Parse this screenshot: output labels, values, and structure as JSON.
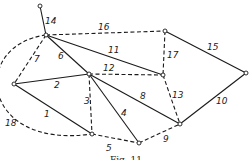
{
  "figure": {
    "caption": "Fig. 11",
    "line_color": "#1a1a1a",
    "background": "#ffffff"
  },
  "nodes": [
    {
      "id": "A",
      "x": 40,
      "y": 6
    },
    {
      "id": "B",
      "x": 46,
      "y": 35
    },
    {
      "id": "C",
      "x": 14,
      "y": 84
    },
    {
      "id": "D",
      "x": 89,
      "y": 74
    },
    {
      "id": "E",
      "x": 92,
      "y": 134
    },
    {
      "id": "F",
      "x": 139,
      "y": 143
    },
    {
      "id": "G",
      "x": 180,
      "y": 124
    },
    {
      "id": "H",
      "x": 163,
      "y": 75
    },
    {
      "id": "I",
      "x": 165,
      "y": 31
    },
    {
      "id": "J",
      "x": 246,
      "y": 73
    }
  ],
  "edges": [
    {
      "label": "1",
      "from": "C",
      "to": "E",
      "style": "solid",
      "lx": 44,
      "ly": 117
    },
    {
      "label": "2",
      "from": "C",
      "to": "D",
      "style": "solid",
      "lx": 54,
      "ly": 88
    },
    {
      "label": "3",
      "from": "D",
      "to": "E",
      "style": "dashed",
      "lx": 84,
      "ly": 104
    },
    {
      "label": "4",
      "from": "D",
      "to": "F",
      "style": "solid",
      "lx": 121,
      "ly": 116
    },
    {
      "label": "5",
      "from": "E",
      "to": "F",
      "style": "dashed",
      "lx": 106,
      "ly": 151
    },
    {
      "label": "6",
      "from": "B",
      "to": "D",
      "style": "solid",
      "lx": 58,
      "ly": 59
    },
    {
      "label": "7",
      "from": "B",
      "to": "C",
      "style": "dashed",
      "lx": 34,
      "ly": 62
    },
    {
      "label": "8",
      "from": "D",
      "to": "G",
      "style": "solid",
      "lx": 140,
      "ly": 99
    },
    {
      "label": "9",
      "from": "F",
      "to": "G",
      "style": "dashed",
      "lx": 163,
      "ly": 142
    },
    {
      "label": "10",
      "from": "J",
      "to": "G",
      "style": "solid",
      "lx": 216,
      "ly": 104
    },
    {
      "label": "11",
      "from": "B",
      "to": "H",
      "style": "solid",
      "lx": 108,
      "ly": 53
    },
    {
      "label": "12",
      "from": "D",
      "to": "H",
      "style": "dashed",
      "lx": 103,
      "ly": 71
    },
    {
      "label": "13",
      "from": "H",
      "to": "G",
      "style": "dashed",
      "lx": 172,
      "ly": 98
    },
    {
      "label": "14",
      "from": "A",
      "to": "B",
      "style": "solid",
      "lx": 45,
      "ly": 24
    },
    {
      "label": "15",
      "from": "I",
      "to": "J",
      "style": "solid",
      "lx": 207,
      "ly": 50
    },
    {
      "label": "16",
      "from": "B",
      "to": "I",
      "style": "dashed",
      "lx": 98,
      "ly": 30
    },
    {
      "label": "17",
      "from": "I",
      "to": "H",
      "style": "dashed",
      "lx": 167,
      "ly": 58
    },
    {
      "label": "18",
      "from": "B",
      "to": "E",
      "style": "dashed-arc",
      "lx": 5,
      "ly": 126
    }
  ]
}
